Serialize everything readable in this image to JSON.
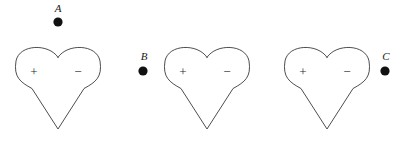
{
  "figure": {
    "width": 407,
    "height": 141,
    "background_color": "#ffffff",
    "outline_color": "#3a3a3a",
    "dot_color": "#111111",
    "text_color": "#1a1a1a"
  },
  "dipoles": [
    {
      "id": "dipole-1",
      "shape": "heart",
      "center_x": 58,
      "top_y": 48,
      "tip_y": 129,
      "half_width": 42,
      "positive_label": "+",
      "positive_x": 34,
      "positive_y": 73,
      "negative_label": "−",
      "negative_x": 78,
      "negative_y": 73
    },
    {
      "id": "dipole-2",
      "shape": "heart",
      "center_x": 207,
      "top_y": 48,
      "tip_y": 129,
      "half_width": 42,
      "positive_label": "+",
      "positive_x": 183,
      "positive_y": 73,
      "negative_label": "−",
      "negative_x": 227,
      "negative_y": 73
    },
    {
      "id": "dipole-3",
      "shape": "heart",
      "center_x": 327,
      "top_y": 48,
      "tip_y": 129,
      "half_width": 42,
      "positive_label": "+",
      "positive_x": 303,
      "positive_y": 73,
      "negative_label": "−",
      "negative_x": 347,
      "negative_y": 73
    }
  ],
  "charges": [
    {
      "id": "charge-a",
      "label": "A",
      "label_x": 58,
      "label_y": 12,
      "dot_x": 58,
      "dot_y": 22,
      "dot_radius": 4.6
    },
    {
      "id": "charge-b",
      "label": "B",
      "label_x": 144,
      "label_y": 60,
      "dot_x": 143,
      "dot_y": 71,
      "dot_radius": 4.6
    },
    {
      "id": "charge-c",
      "label": "C",
      "label_x": 386,
      "label_y": 60,
      "dot_x": 385,
      "dot_y": 71,
      "dot_radius": 4.6
    }
  ]
}
